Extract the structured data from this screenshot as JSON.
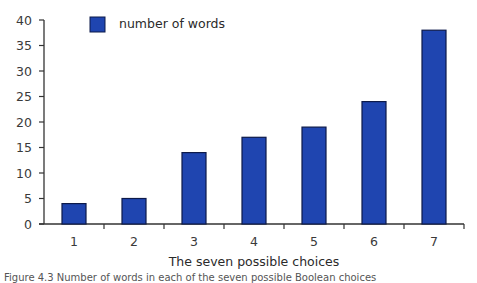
{
  "chart_data": {
    "type": "bar",
    "title": "",
    "xlabel": "The seven possible choices",
    "ylabel": "",
    "categories": [
      "1",
      "2",
      "3",
      "4",
      "5",
      "6",
      "7"
    ],
    "series": [
      {
        "name": "number of words",
        "values": [
          4,
          5,
          14,
          17,
          19,
          24,
          38
        ],
        "color": "#1f45b0"
      }
    ],
    "ylim": [
      0,
      40
    ],
    "yticks": [
      0,
      5,
      10,
      15,
      20,
      25,
      30,
      35,
      40
    ],
    "grid": false,
    "legend_position": "top-left inside"
  },
  "colors": {
    "bar_fill": "#1f45b0",
    "bar_stroke": "#0d1a4a",
    "axis": "#333333"
  },
  "caption": "Figure 4.3  Number of words in each of the seven possible Boolean choices"
}
